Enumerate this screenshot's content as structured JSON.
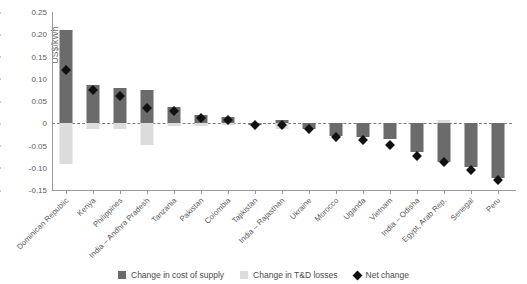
{
  "chart_data": {
    "type": "bar",
    "title": "",
    "xlabel": "",
    "ylabel": "US$/kWh",
    "ylim": [
      -0.15,
      0.25
    ],
    "ytick_labels": [
      "0.25",
      "0.20",
      "0.15",
      "0.10",
      "0.05",
      "0",
      "-0.05",
      "-0.10",
      "-0.15"
    ],
    "ytick_values": [
      0.25,
      0.2,
      0.15,
      0.1,
      0.05,
      0,
      -0.05,
      -0.1,
      -0.15
    ],
    "grid": false,
    "legend_position": "bottom",
    "categories": [
      "Dominican Republic",
      "Kenya",
      "Philippines",
      "India – Andhra Pradesh",
      "Tanzania",
      "Pakistan",
      "Colombia",
      "Tajikistan",
      "India – Rajasthan",
      "Ukraine",
      "Morocco",
      "Uganda",
      "Vietnam",
      "India – Odisha",
      "Egypt, Arab Rep.",
      "Senegal",
      "Peru"
    ],
    "series": [
      {
        "name": "Change in cost of supply",
        "color": "#6b6b6b",
        "values": [
          0.21,
          0.085,
          0.079,
          0.075,
          0.036,
          0.019,
          0.013,
          -0.003,
          0.008,
          -0.012,
          -0.028,
          -0.031,
          -0.036,
          -0.065,
          -0.088,
          -0.098,
          -0.122
        ]
      },
      {
        "name": "Change in T&D losses",
        "color": "#dcdcdc",
        "values": [
          -0.091,
          -0.012,
          -0.014,
          -0.049,
          -0.007,
          -0.006,
          -0.004,
          0.0,
          -0.012,
          0.0,
          -0.004,
          -0.006,
          -0.01,
          0.0,
          0.008,
          -0.006,
          -0.007
        ]
      },
      {
        "name": "Net change",
        "color": "#111111",
        "marker": "diamond",
        "values": [
          0.12,
          0.074,
          0.062,
          0.034,
          0.028,
          0.012,
          0.008,
          -0.003,
          -0.005,
          -0.013,
          -0.032,
          -0.038,
          -0.048,
          -0.073,
          -0.086,
          -0.105,
          -0.128
        ]
      }
    ]
  },
  "legend": {
    "items": [
      {
        "label": "Change in cost of supply",
        "color": "#6b6b6b",
        "shape": "square"
      },
      {
        "label": "Change in T&D losses",
        "color": "#dcdcdc",
        "shape": "square"
      },
      {
        "label": "Net change",
        "color": "#111111",
        "shape": "diamond"
      }
    ]
  }
}
